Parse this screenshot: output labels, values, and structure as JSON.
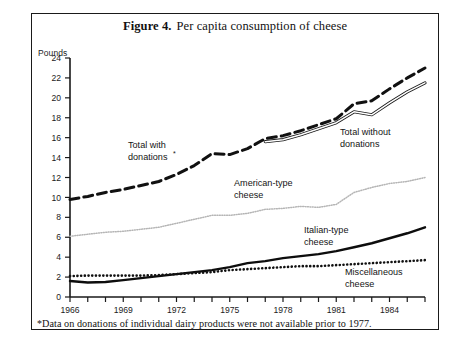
{
  "figure": {
    "number_label": "Figure 4.",
    "title": "Per capita consumption of cheese",
    "axis_unit": "Pounds",
    "footnote_marker": "*",
    "footnote": "Data on donations of individual dairy products were not available prior to 1977."
  },
  "chart_data": {
    "type": "line",
    "xlabel": "",
    "ylabel": "Pounds",
    "xlim": [
      1966,
      1986
    ],
    "ylim": [
      0,
      24
    ],
    "ytick_step": 2,
    "xtick_step": 1,
    "xtick_label_step": 3,
    "grid": false,
    "legend": "inline-annotations",
    "yticks": [
      0,
      2,
      4,
      6,
      8,
      10,
      12,
      14,
      16,
      18,
      20,
      22,
      24
    ],
    "xticks": [
      1966,
      1967,
      1968,
      1969,
      1970,
      1971,
      1972,
      1973,
      1974,
      1975,
      1976,
      1977,
      1978,
      1979,
      1980,
      1981,
      1982,
      1983,
      1984,
      1985,
      1986
    ],
    "xtick_labels": [
      "1966",
      "1969",
      "1972",
      "1975",
      "1978",
      "1981",
      "1984"
    ],
    "xtick_labels_years": [
      1966,
      1969,
      1972,
      1975,
      1978,
      1981,
      1984
    ],
    "x": [
      1966,
      1967,
      1968,
      1969,
      1970,
      1971,
      1972,
      1973,
      1974,
      1975,
      1976,
      1977,
      1978,
      1979,
      1980,
      1981,
      1982,
      1983,
      1984,
      1985,
      1986
    ],
    "series": [
      {
        "name": "Total with donations*",
        "label_line1": "Total with",
        "label_line2": "donations",
        "label_sup": "*",
        "style": "dashed",
        "color": "#111111",
        "values": [
          9.8,
          10.1,
          10.5,
          10.8,
          11.2,
          11.6,
          12.3,
          13.2,
          14.4,
          14.3,
          14.9,
          15.9,
          16.2,
          16.7,
          17.3,
          17.9,
          19.4,
          19.7,
          20.9,
          22.0,
          23.0
        ]
      },
      {
        "name": "Total without donations",
        "label_line1": "Total without",
        "label_line2": "donations",
        "style": "double-thin",
        "color": "#1a1a1a",
        "values": [
          null,
          null,
          null,
          null,
          null,
          null,
          null,
          null,
          null,
          null,
          null,
          15.6,
          15.8,
          16.3,
          16.9,
          17.5,
          18.6,
          18.3,
          19.5,
          20.6,
          21.5
        ]
      },
      {
        "name": "American-type cheese",
        "label_line1": "American-type",
        "label_line2": "cheese",
        "style": "dotted-fine",
        "color": "#b9b9b9",
        "values": [
          6.1,
          6.3,
          6.5,
          6.6,
          6.8,
          7.0,
          7.4,
          7.8,
          8.2,
          8.2,
          8.4,
          8.8,
          8.9,
          9.1,
          9.0,
          9.3,
          10.5,
          11.0,
          11.4,
          11.6,
          12.0
        ]
      },
      {
        "name": "Italian-type cheese",
        "label_line1": "Italian-type",
        "label_line2": "cheese",
        "style": "solid-thick",
        "color": "#0d0d0d",
        "values": [
          1.6,
          1.45,
          1.5,
          1.7,
          1.9,
          2.1,
          2.3,
          2.5,
          2.7,
          3.0,
          3.4,
          3.6,
          3.9,
          4.1,
          4.3,
          4.6,
          5.0,
          5.4,
          5.9,
          6.4,
          7.0
        ]
      },
      {
        "name": "Miscellaneous cheese",
        "label_line1": "Miscellaneous",
        "label_line2": "cheese",
        "style": "dotted-bold",
        "color": "#111111",
        "values": [
          2.1,
          2.15,
          2.15,
          2.15,
          2.15,
          2.2,
          2.3,
          2.4,
          2.5,
          2.7,
          2.8,
          2.9,
          3.0,
          3.1,
          3.1,
          3.2,
          3.3,
          3.4,
          3.5,
          3.6,
          3.7
        ]
      }
    ],
    "annotations": [
      {
        "text": "Total with donations*",
        "x_px": 128,
        "y_px": 148
      },
      {
        "text": "Total without donations",
        "x_px": 340,
        "y_px": 135
      },
      {
        "text": "American-type cheese",
        "x_px": 234,
        "y_px": 186
      },
      {
        "text": "Italian-type cheese",
        "x_px": 304,
        "y_px": 233
      },
      {
        "text": "Miscellaneous cheese",
        "x_px": 345,
        "y_px": 275
      }
    ]
  }
}
